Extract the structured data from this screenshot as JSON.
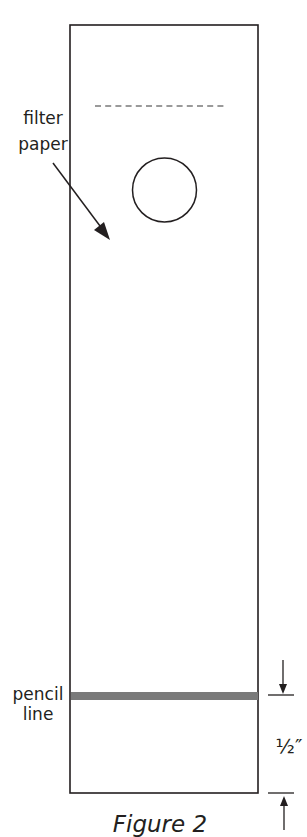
{
  "figure": {
    "caption": "Figure 2",
    "colors": {
      "stroke": "#231f20",
      "pencil_line": "#7a7a7a",
      "dashed_line": "#9a9a9a",
      "background": "#ffffff"
    }
  },
  "labels": {
    "filter_paper": [
      "filter",
      "paper"
    ],
    "pencil_line": [
      "pencil",
      "line"
    ],
    "measurement": "½″"
  },
  "elements": {
    "strip": {
      "x": 70,
      "y": 25,
      "width": 188,
      "height": 768
    },
    "dashed_line": {
      "x1": 95,
      "x2": 226,
      "y": 106,
      "dash_count": 13
    },
    "circle": {
      "cx": 164.5,
      "cy": 190,
      "r": 32
    },
    "pencil_line": {
      "y": 696,
      "thickness": 7
    },
    "dimension": {
      "top_tick_y": 696,
      "bottom_tick_y": 793,
      "value": "½″"
    }
  }
}
